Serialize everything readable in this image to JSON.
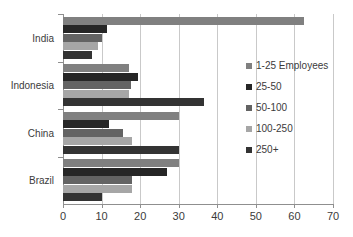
{
  "chart_data": {
    "type": "bar",
    "orientation": "horizontal",
    "title": "",
    "xlabel": "",
    "ylabel": "",
    "categories": [
      "India",
      "Indonesia",
      "China",
      "Brazil"
    ],
    "series": [
      {
        "name": "1-25 Employees",
        "color": "#808080",
        "values": [
          62.5,
          17.0,
          30.0,
          30.0
        ]
      },
      {
        "name": "25-50",
        "color": "#262626",
        "values": [
          11.5,
          19.5,
          12.0,
          27.0
        ]
      },
      {
        "name": "50-100",
        "color": "#636363",
        "values": [
          10.0,
          17.5,
          15.5,
          18.0
        ]
      },
      {
        "name": "100-250",
        "color": "#a6a6a6",
        "values": [
          9.0,
          17.0,
          18.0,
          18.0
        ]
      },
      {
        "name": "250+",
        "color": "#333333",
        "values": [
          7.5,
          36.5,
          30.0,
          10.0
        ]
      }
    ],
    "xlim": [
      0,
      70
    ],
    "xticks": [
      0,
      10,
      20,
      30,
      40,
      50,
      60,
      70
    ],
    "xtick_labels": [
      "0",
      "10",
      "20",
      "30",
      "40",
      "50",
      "60",
      "70"
    ],
    "grid": true,
    "legend_position": "right"
  },
  "legend": {
    "items": [
      {
        "label": "1-25 Employees"
      },
      {
        "label": "25-50"
      },
      {
        "label": "50-100"
      },
      {
        "label": "100-250"
      },
      {
        "label": "250+"
      }
    ]
  },
  "axis": {
    "x_labels": [
      "0",
      "10",
      "20",
      "30",
      "40",
      "50",
      "60",
      "70"
    ],
    "y_labels": [
      "India",
      "Indonesia",
      "China",
      "Brazil"
    ]
  },
  "colors": {
    "series_1": "#808080",
    "series_2": "#262626",
    "series_3": "#636363",
    "series_4": "#a6a6a6",
    "series_5": "#333333",
    "gridline": "#c9c9c9",
    "axis": "#8f8f8f",
    "text": "#3b3b3b",
    "background": "#ffffff"
  }
}
